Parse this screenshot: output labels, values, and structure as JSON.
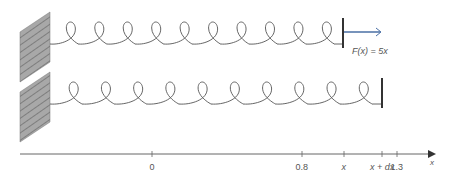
{
  "diagram": {
    "type": "spring-force-diagram",
    "springs": [
      {
        "name": "stretched-spring-top",
        "loops": 10,
        "end_x": 343
      },
      {
        "name": "stretched-spring-bottom",
        "loops": 10,
        "end_x": 382
      }
    ],
    "force": {
      "label": "F(x) = 5x",
      "arrow_color": "#4a6fa5",
      "direction": "right"
    },
    "axis": {
      "label": "x",
      "ticks": [
        {
          "label": "0",
          "x": 152
        },
        {
          "label": "0.8",
          "x": 302
        },
        {
          "label": "x",
          "x": 344
        },
        {
          "label": "x + dx",
          "x": 382
        },
        {
          "label": "1.3",
          "x": 397
        }
      ]
    },
    "colors": {
      "line": "#555555",
      "wall": "#9a9a9a",
      "arrow": "#4a6fa5"
    }
  }
}
